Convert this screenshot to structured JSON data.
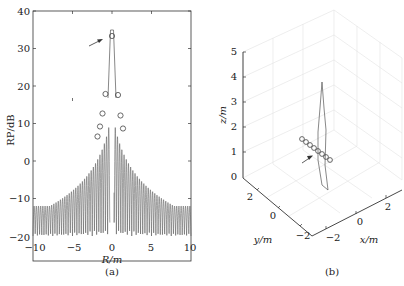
{
  "chart_data": [
    {
      "panel": "(a)",
      "type": "line",
      "xlabel": "R/m",
      "ylabel": "RP/dB",
      "xlim": [
        -10,
        10
      ],
      "ylim": [
        -20,
        40
      ],
      "xticks": [
        "-10",
        "-5",
        "0",
        "5",
        "10"
      ],
      "yticks": [
        "-20",
        "-10",
        "0",
        "10",
        "20",
        "30",
        "40"
      ],
      "grid": false,
      "series": [
        {
          "name": "radiation pattern",
          "style": "dense oscillating grey line, envelope decaying from center to about -12 dB at edges, troughs reaching -20 dB",
          "envelope_x": [
            -10,
            -8,
            -6,
            -4,
            -2,
            -1,
            0,
            1,
            2,
            4,
            6,
            8,
            10
          ],
          "envelope_y": [
            -12,
            -10,
            -8,
            -5,
            0,
            10,
            33,
            10,
            0,
            -5,
            -8,
            -10,
            -12
          ]
        },
        {
          "name": "markers",
          "style": "open circles",
          "x": [
            -1.2,
            -1.0,
            -0.7,
            -0.4,
            0,
            0.4,
            0.7,
            1.0
          ],
          "y": [
            6.5,
            9,
            12.5,
            18,
            33,
            17.5,
            12,
            8.5
          ]
        }
      ],
      "annotations": [
        {
          "type": "arrow",
          "points_to": [
            0,
            33
          ]
        }
      ]
    },
    {
      "panel": "(b)",
      "type": "line3d",
      "xlabel": "x/m",
      "ylabel": "y/m",
      "zlabel": "z/m",
      "xlim": [
        -3,
        3
      ],
      "ylim": [
        -3,
        3
      ],
      "zlim": [
        0,
        5
      ],
      "xticks": [
        "-2",
        "0",
        "2"
      ],
      "yticks": [
        "-2",
        "0",
        "2"
      ],
      "zticks": [
        "0",
        "1",
        "2",
        "3",
        "4",
        "5"
      ],
      "grid": true,
      "series": [
        {
          "name": "beam lobe",
          "style": "thin spindle shape rising to z≈3.8"
        },
        {
          "name": "array elements",
          "style": "8 open circles in a diagonal line at z≈1.3"
        }
      ],
      "annotations": [
        {
          "type": "arrow",
          "points_to": "array elements"
        }
      ]
    }
  ],
  "labels": {
    "a": {
      "panel": "(a)",
      "xlabel": "R/m",
      "ylabel": "RP/dB",
      "xticks": [
        "−10",
        "−5",
        "0",
        "5",
        "10"
      ],
      "yticks": [
        "40",
        "30",
        "20",
        "10",
        "0",
        "−10",
        "−20"
      ]
    },
    "b": {
      "panel": "(b)",
      "xlabel": "x/m",
      "ylabel": "y/m",
      "zlabel": "z/m",
      "zticks": [
        "5",
        "4",
        "3",
        "2",
        "1",
        "0"
      ],
      "yticks": [
        "2",
        "0",
        "−2"
      ],
      "xticks": [
        "−2",
        "0",
        "2"
      ]
    }
  }
}
